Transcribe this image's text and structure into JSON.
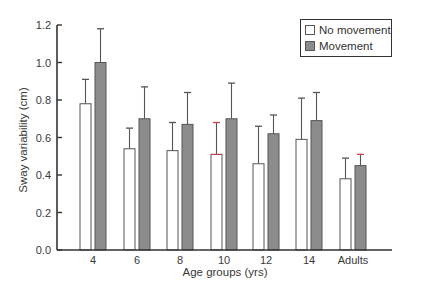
{
  "chart_data": {
    "type": "bar",
    "title": "",
    "xlabel": "Age groups (yrs)",
    "ylabel": "Sway variability (cm)",
    "ylim": [
      0,
      1.2
    ],
    "yticks": [
      "0.0",
      "0.2",
      "0.4",
      "0.6",
      "0.8",
      "1.0",
      "1.2"
    ],
    "ytick_values": [
      0,
      0.2,
      0.4,
      0.6,
      0.8,
      1.0,
      1.2
    ],
    "categories": [
      "4",
      "6",
      "8",
      "10",
      "12",
      "14",
      "Adults"
    ],
    "grid": false,
    "legend_position": "top-right",
    "series": [
      {
        "name": "No movement",
        "color": "#ffffff",
        "values": [
          0.78,
          0.54,
          0.53,
          0.51,
          0.46,
          0.59,
          0.38
        ],
        "error_upper": [
          0.91,
          0.65,
          0.68,
          0.68,
          0.66,
          0.81,
          0.49
        ]
      },
      {
        "name": "Movement",
        "color": "#8c8c8c",
        "values": [
          1.0,
          0.7,
          0.67,
          0.7,
          0.62,
          0.69,
          0.45
        ],
        "error_upper": [
          1.18,
          0.87,
          0.84,
          0.89,
          0.72,
          0.84,
          0.51
        ]
      }
    ]
  },
  "legend": {
    "items": [
      {
        "label": "No movement",
        "color": "#ffffff"
      },
      {
        "label": "Movement",
        "color": "#8c8c8c"
      }
    ]
  },
  "colors": {
    "axis": "#333333",
    "bar_outline": "#555555",
    "error_bar": "#555555",
    "error_bar_accent": "#d04050"
  }
}
